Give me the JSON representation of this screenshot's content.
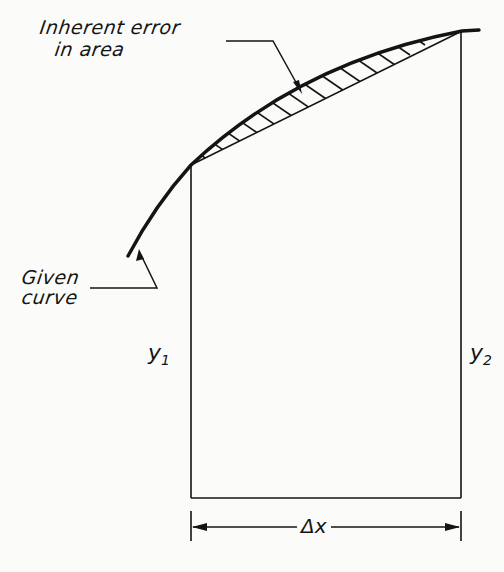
{
  "figure": {
    "labels": {
      "inherent_error_line1": "Inherent error",
      "inherent_error_line2": "in area",
      "given_curve_line1": "Given",
      "given_curve_line2": "curve",
      "y1_main": "y",
      "y1_sub": "1",
      "y2_main": "y",
      "y2_sub": "2",
      "delta_x": "Δx"
    },
    "caption": "",
    "colors": {
      "ink": "#141414",
      "background": "#fbfbfa"
    },
    "elements": {
      "curve": "given-curve (concave down, rising left to right)",
      "chord": "straight line joining tops of y1 and y2 ordinates",
      "hatched_region": "area between curve and chord = inherent error",
      "ordinates": [
        "y1",
        "y2"
      ],
      "dimension": "Δx between ordinates"
    }
  }
}
